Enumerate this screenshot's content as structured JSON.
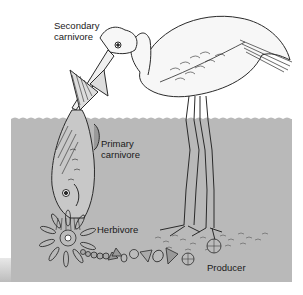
{
  "diagram": {
    "colors": {
      "water": "#b9b9b9",
      "background": "#ffffff",
      "line": "#2a2a2a",
      "bird_fill": "#f7f7f7"
    },
    "labels": {
      "secondary_carnivore": {
        "line1": "Secondary",
        "line2": "carnivore"
      },
      "primary_carnivore": {
        "line1": "Primary",
        "line2": "carnivore"
      },
      "herbivore": "Herbivore",
      "producer": "Producer"
    },
    "organisms": [
      {
        "role": "Secondary carnivore",
        "depiction": "heron/egret"
      },
      {
        "role": "Primary carnivore",
        "depiction": "fish"
      },
      {
        "role": "Herbivore",
        "depiction": "zooplankton (rotifer-like)"
      },
      {
        "role": "Producer",
        "depiction": "phytoplankton / diatoms"
      }
    ]
  }
}
